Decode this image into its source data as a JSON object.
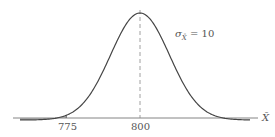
{
  "chart_data": {
    "type": "area",
    "title": "",
    "mean": 800,
    "sigma_label": "σ_X̄ = 10",
    "sigma": 10,
    "shaded_region": {
      "from": "-inf",
      "to": 775
    },
    "xlabel": "X̄",
    "ylabel": "",
    "tick_labels": [
      "775",
      "800"
    ],
    "x_ticks": [
      775,
      800
    ],
    "grid": false,
    "legend": "none",
    "reference_line": {
      "x": 800,
      "style": "dashed"
    }
  },
  "labels": {
    "tick_775": "775",
    "tick_800": "800",
    "axis_x": "X̄",
    "sigma_symbol": "σ",
    "sigma_sub": "X̄",
    "sigma_value": "= 10"
  },
  "colors": {
    "curve": "#444444",
    "shade": "#c8c8c8",
    "axis": "#666666",
    "dashed": "#888888"
  }
}
